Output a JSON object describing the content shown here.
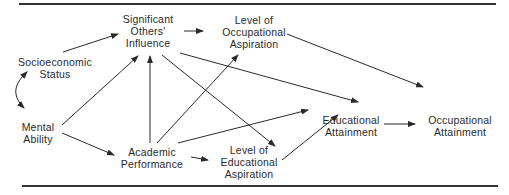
{
  "diagram": {
    "nodes": {
      "socioeconomic_status": {
        "lines": [
          "Socioeconomic",
          "Status"
        ]
      },
      "mental_ability": {
        "lines": [
          "Mental",
          "Ability"
        ]
      },
      "significant_others_influence": {
        "lines": [
          "Significant",
          "Others'",
          "Influence"
        ]
      },
      "level_of_occupational_aspiration": {
        "lines": [
          "Level of",
          "Occupational",
          "Aspiration"
        ]
      },
      "academic_performance": {
        "lines": [
          "Academic",
          "Performance"
        ]
      },
      "level_of_educational_aspiration": {
        "lines": [
          "Level of",
          "Educational",
          "Aspiration"
        ]
      },
      "educational_attainment": {
        "lines": [
          "Educational",
          "Attainment"
        ]
      },
      "occupational_attainment": {
        "lines": [
          "Occupational",
          "Attainment"
        ]
      }
    },
    "edges": [
      {
        "from": "Socioeconomic Status",
        "to": "Significant Others' Influence"
      },
      {
        "from": "Socioeconomic Status",
        "to": "Mental Ability",
        "bidirectional": true
      },
      {
        "from": "Mental Ability",
        "to": "Significant Others' Influence"
      },
      {
        "from": "Mental Ability",
        "to": "Academic Performance"
      },
      {
        "from": "Academic Performance",
        "to": "Significant Others' Influence"
      },
      {
        "from": "Academic Performance",
        "to": "Level of Occupational Aspiration"
      },
      {
        "from": "Academic Performance",
        "to": "Educational Attainment"
      },
      {
        "from": "Academic Performance",
        "to": "Level of Educational Aspiration"
      },
      {
        "from": "Significant Others' Influence",
        "to": "Level of Occupational Aspiration"
      },
      {
        "from": "Significant Others' Influence",
        "to": "Educational Attainment"
      },
      {
        "from": "Significant Others' Influence",
        "to": "Level of Educational Aspiration"
      },
      {
        "from": "Level of Occupational Aspiration",
        "to": "Occupational Attainment"
      },
      {
        "from": "Level of Educational Aspiration",
        "to": "Educational Attainment"
      },
      {
        "from": "Educational Attainment",
        "to": "Occupational Attainment"
      }
    ]
  }
}
